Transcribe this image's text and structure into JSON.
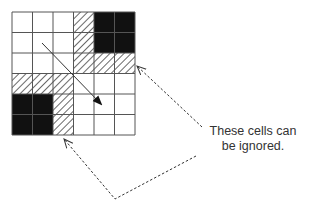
{
  "diagram": {
    "grid": {
      "rows": 6,
      "cols": 6,
      "origin": [
        12,
        12
      ],
      "cell_size": 20.5,
      "legend": {
        "W": "empty",
        "H": "hatched",
        "B": "blocked"
      },
      "cells": [
        [
          "W",
          "W",
          "W",
          "H",
          "B",
          "B"
        ],
        [
          "W",
          "W",
          "W",
          "H",
          "B",
          "B"
        ],
        [
          "W",
          "W",
          "W",
          "H",
          "H",
          "H"
        ],
        [
          "H",
          "H",
          "H",
          "W",
          "W",
          "W"
        ],
        [
          "B",
          "B",
          "H",
          "W",
          "W",
          "W"
        ],
        [
          "B",
          "B",
          "H",
          "W",
          "W",
          "W"
        ]
      ]
    },
    "direction_arrow": {
      "from": [
        42,
        43
      ],
      "to": [
        101,
        104
      ]
    },
    "callout": {
      "lines": [
        "These cells can",
        "be ignored."
      ]
    },
    "pointers": [
      {
        "points": [
          [
            202,
            127
          ],
          [
            137,
            66
          ]
        ]
      },
      {
        "points": [
          [
            196,
            156
          ],
          [
            115,
            199
          ],
          [
            64,
            139
          ]
        ]
      }
    ],
    "colors": {
      "grid_line": "#555555",
      "blocked": "#111111",
      "hatch": "#444444",
      "text": "#333333"
    }
  }
}
